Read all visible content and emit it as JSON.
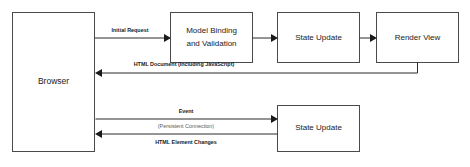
{
  "diagram": {
    "background_color": "#ffffff",
    "box_stroke_color": "#4a4a4a",
    "line_color": "#2b2b2b",
    "label_color": "#1a1a1a",
    "muted_label_color": "#5a5a5a"
  },
  "nodes": {
    "browser": {
      "label": "Browser"
    },
    "model_binding": {
      "label_line1": "Model Binding",
      "label_line2": "and Validation"
    },
    "state_update_top": {
      "label": "State Update"
    },
    "render_view": {
      "label": "Render View"
    },
    "state_update_bottom": {
      "label": "State Update"
    }
  },
  "edges": {
    "initial_request": {
      "label": "Initial Request"
    },
    "binding_to_state": {
      "label": ""
    },
    "state_to_render": {
      "label": ""
    },
    "html_document": {
      "label": "HTML Document (Including JavaScript)"
    },
    "event": {
      "label": "Event"
    },
    "persistent_connection": {
      "label": "(Persistent Connection)"
    },
    "html_element_changes": {
      "label": "HTML Element Changes"
    }
  }
}
